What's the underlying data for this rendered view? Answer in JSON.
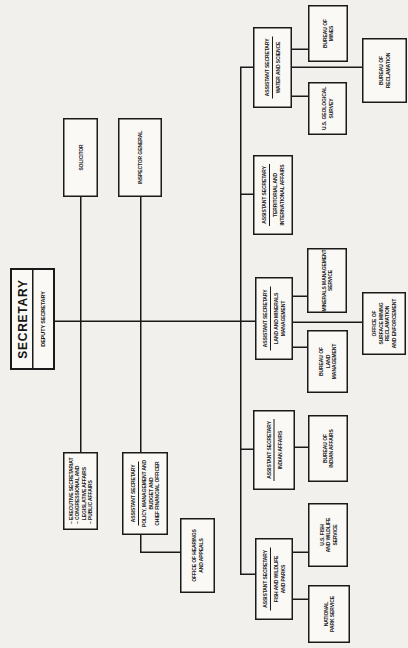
{
  "colors": {
    "page_bg": "#f1f0ec",
    "box_bg": "#faf9f6",
    "line": "#1a1a1a",
    "text": "#151515"
  },
  "secretary": {
    "title": "SECRETARY",
    "deputy": "DEPUTY SECRETARY"
  },
  "offices": {
    "executive_secretariat": [
      "– EXECUTIVE SECRETARIAT",
      "– CONGRESSIONAL AND",
      "   LEGISLATIVE AFFAIRS",
      "– PUBLIC AFFAIRS"
    ],
    "policy_management_budget": {
      "header": "ASSISTANT SECRETARY",
      "lines": [
        "POLICY, MANAGEMENT AND",
        "BUDGET AND",
        "CHIEF FINANCIAL OFFICER"
      ]
    },
    "hearings_appeals": [
      "OFFICE OF HEARINGS",
      "AND APPEALS"
    ],
    "solicitor": "SOLICITOR",
    "inspector_general": "INSPECTOR GENERAL"
  },
  "assistant_secretaries": [
    {
      "header": "ASSISTANT SECRETARY",
      "dept": [
        "FISH AND WILDLIFE",
        "AND PARKS"
      ]
    },
    {
      "header": "ASSISTANT SECRETARY",
      "dept": [
        "INDIAN AFFAIRS"
      ]
    },
    {
      "header": "ASSISTANT SECRETARY",
      "dept": [
        "LAND AND MINERALS",
        "MANAGEMENT"
      ]
    },
    {
      "header": "ASSISTANT SECRETARY",
      "dept": [
        "TERRITORIAL AND",
        "INTERNATIONAL AFFAIRS"
      ]
    },
    {
      "header": "ASSISTANT SECRETARY",
      "dept": [
        "WATER AND SCIENCE"
      ]
    }
  ],
  "bureaus": [
    {
      "lines": [
        "NATIONAL",
        "PARK SERVICE"
      ]
    },
    {
      "lines": [
        "U.S. FISH",
        "AND WILDLIFE",
        "SERVICE"
      ]
    },
    {
      "lines": [
        "BUREAU OF",
        "INDIAN AFFAIRS"
      ]
    },
    {
      "lines": [
        "BUREAU OF",
        "LAND",
        "MANAGEMENT"
      ]
    },
    {
      "lines": [
        "MINERALS MANAGEMENT",
        "SERVICE"
      ]
    },
    {
      "lines": [
        "OFFICE OF",
        "SURFACE MINING",
        "RECLAMATION",
        "AND ENFORCEMENT"
      ]
    },
    {
      "lines": [
        "U.S. GEOLOGICAL",
        "SURVEY"
      ]
    },
    {
      "lines": [
        "BUREAU OF",
        "MINES"
      ]
    },
    {
      "lines": [
        "BUREAU OF",
        "RECLAMATION"
      ]
    }
  ]
}
